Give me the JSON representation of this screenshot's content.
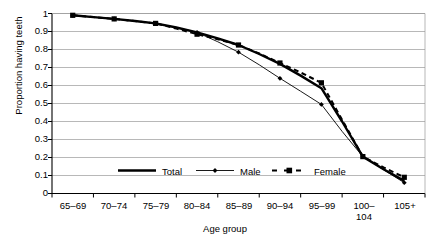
{
  "chart_data": {
    "type": "line",
    "title": "",
    "xlabel": "Age group",
    "ylabel": "Proportion having teeth",
    "ylim": [
      0,
      1
    ],
    "yticks": [
      "0",
      "0.1",
      "0.2",
      "0.3",
      "0.4",
      "0.5",
      "0.6",
      "0.7",
      "0.8",
      "0.9",
      "1"
    ],
    "grid": true,
    "legend_position": "inside-bottom-center",
    "categories": [
      "65–69",
      "70–74",
      "75–79",
      "80–84",
      "85–89",
      "90–94",
      "95–99",
      "100–104",
      "105+"
    ],
    "x": [
      0,
      1,
      2,
      3,
      4,
      5,
      6,
      7,
      8
    ],
    "series": [
      {
        "name": "Total",
        "style": "thick-solid",
        "marker": "none",
        "color": "#000000",
        "values": [
          0.99,
          0.97,
          0.945,
          0.895,
          0.825,
          0.72,
          0.585,
          0.205,
          0.07
        ]
      },
      {
        "name": "Male",
        "style": "thin-solid",
        "marker": "diamond",
        "color": "#000000",
        "values": [
          0.99,
          0.97,
          0.945,
          0.895,
          0.785,
          0.64,
          0.495,
          0.205,
          0.06
        ]
      },
      {
        "name": "Female",
        "style": "dashed",
        "marker": "square",
        "color": "#000000",
        "values": [
          0.99,
          0.97,
          0.945,
          0.885,
          0.825,
          0.725,
          0.615,
          0.205,
          0.09
        ]
      }
    ],
    "series_dense": {
      "x": [
        0,
        0.5,
        1,
        1.5,
        2,
        2.5,
        3,
        3.5,
        4,
        4.5,
        5,
        5.5,
        6,
        6.5,
        7,
        7.5,
        8
      ],
      "total": [
        0.99,
        0.98,
        0.97,
        0.958,
        0.945,
        0.922,
        0.895,
        0.862,
        0.825,
        0.775,
        0.72,
        0.655,
        0.585,
        0.4,
        0.205,
        0.135,
        0.07
      ],
      "male": [
        0.99,
        0.98,
        0.97,
        0.958,
        0.945,
        0.922,
        0.895,
        0.843,
        0.785,
        0.715,
        0.64,
        0.568,
        0.495,
        0.345,
        0.205,
        0.132,
        0.06
      ],
      "female": [
        0.99,
        0.98,
        0.97,
        0.958,
        0.945,
        0.916,
        0.885,
        0.857,
        0.825,
        0.778,
        0.725,
        0.672,
        0.615,
        0.41,
        0.205,
        0.145,
        0.09
      ]
    },
    "legend": [
      {
        "label": "Total",
        "style": "thick-solid",
        "marker": "none"
      },
      {
        "label": "Male",
        "style": "thin-solid",
        "marker": "diamond"
      },
      {
        "label": "Female",
        "style": "dashed",
        "marker": "square"
      }
    ]
  },
  "colors": {
    "axis": "#000000",
    "grid": "#999999",
    "series": "#000000",
    "background": "#ffffff"
  }
}
